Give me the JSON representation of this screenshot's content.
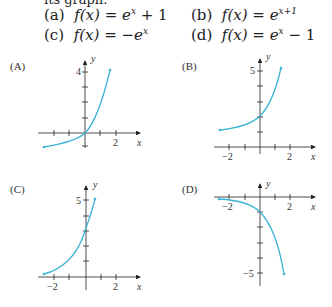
{
  "intro_cut": "its graph.",
  "options": [
    {
      "id": "a",
      "label": "(a)",
      "formula": "f(x) = e^x + 1",
      "lhs": "f(x) = ",
      "base": "e",
      "exp": "x",
      "tail": " + 1"
    },
    {
      "id": "b",
      "label": "(b)",
      "formula": "f(x) = e^(x+1)",
      "lhs": "f(x) = ",
      "base": "e",
      "exp": "x+1",
      "tail": ""
    },
    {
      "id": "c",
      "label": "(c)",
      "formula": "f(x) = -e^x",
      "lhs": "f(x) = −",
      "base": "e",
      "exp": "x",
      "tail": ""
    },
    {
      "id": "d",
      "label": "(d)",
      "formula": "f(x) = e^x - 1",
      "lhs": "f(x) = ",
      "base": "e",
      "exp": "x",
      "tail": " − 1"
    }
  ],
  "graphs": [
    {
      "label": "(A)",
      "y_tick_label": "4",
      "x_tick_label": "2",
      "x_axis": "x",
      "y_axis": "y"
    },
    {
      "label": "(B)",
      "y_tick_label": "5",
      "x_tick_labels": [
        "−2",
        "2"
      ],
      "x_axis": "x",
      "y_axis": "y"
    },
    {
      "label": "(C)",
      "y_tick_label": "5",
      "x_tick_labels": [
        "−2",
        "2"
      ],
      "x_axis": "x",
      "y_axis": "y"
    },
    {
      "label": "(D)",
      "y_tick_label": "−5",
      "x_tick_labels": [
        "−2",
        "2"
      ],
      "x_axis": "x",
      "y_axis": "y"
    }
  ],
  "colors": {
    "curve": "#3bb3d6",
    "axis": "#222222"
  }
}
